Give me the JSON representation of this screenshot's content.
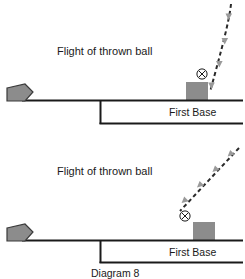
{
  "figure": {
    "caption": "Diagram 8",
    "background_color": "#ffffff",
    "line_color": "#1a1a1a",
    "fill_gray": "#8c8c8c",
    "arrow_gray": "#9a9a9a",
    "dash_color": "#2a2a2a"
  },
  "panels": [
    {
      "id": "top",
      "name": "top-panel",
      "flight_label": "Flight of thrown ball",
      "base_label": "First Base",
      "ball_marker": "⊗",
      "trajectory": "near-vertical descending",
      "home_plate": "home-plate"
    },
    {
      "id": "bottom",
      "name": "bottom-panel",
      "flight_label": "Flight of thrown ball",
      "base_label": "First Base",
      "ball_marker": "⊗",
      "trajectory": "diagonal descending from upper right",
      "home_plate": "home-plate"
    }
  ]
}
